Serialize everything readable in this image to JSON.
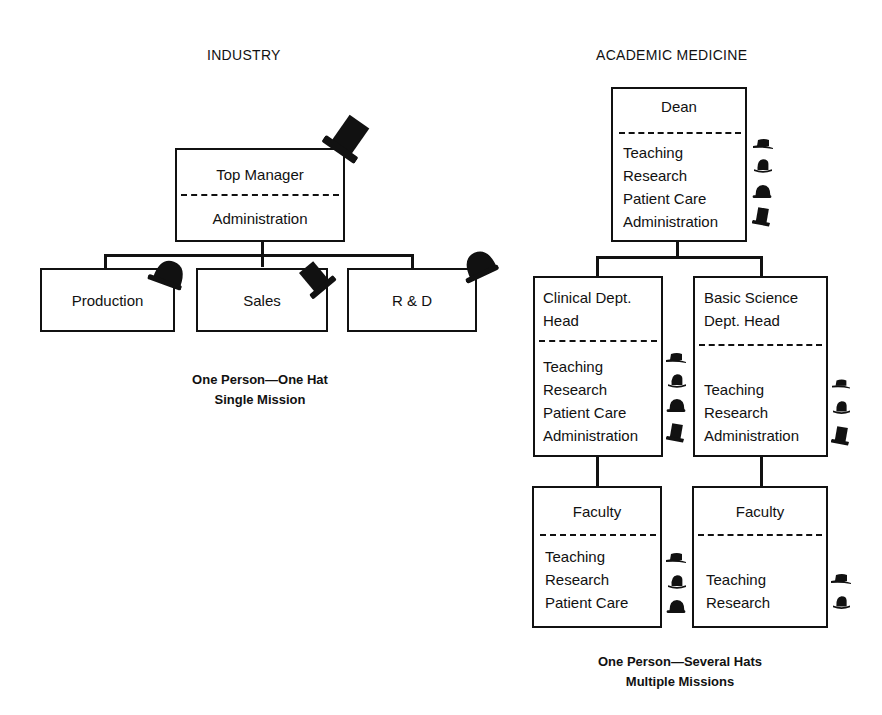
{
  "industry": {
    "heading": "INDUSTRY",
    "top": {
      "title": "Top Manager",
      "role": "Administration",
      "hat": "top-hat"
    },
    "children": [
      {
        "title": "Production",
        "hat": "bowler-hat"
      },
      {
        "title": "Sales",
        "hat": "top-hat"
      },
      {
        "title": "R & D",
        "hat": "bowler-hat"
      }
    ],
    "caption": {
      "line1": "One Person—One Hat",
      "line2": "Single Mission"
    }
  },
  "academic": {
    "heading": "ACADEMIC MEDICINE",
    "dean": {
      "title": "Dean",
      "roles": [
        "Teaching",
        "Research",
        "Patient Care",
        "Administration"
      ]
    },
    "clinical_head": {
      "title_line1": "Clinical Dept.",
      "title_line2": "Head",
      "roles": [
        "Teaching",
        "Research",
        "Patient Care",
        "Administration"
      ]
    },
    "basic_head": {
      "title_line1": "Basic Science",
      "title_line2": "Dept. Head",
      "roles": [
        "Teaching",
        "Research",
        "Administration"
      ]
    },
    "clinical_faculty": {
      "title": "Faculty",
      "roles": [
        "Teaching",
        "Research",
        "Patient Care"
      ]
    },
    "basic_faculty": {
      "title": "Faculty",
      "roles": [
        "Teaching",
        "Research"
      ]
    },
    "caption": {
      "line1": "One Person—Several Hats",
      "line2": "Multiple Missions"
    }
  },
  "hat_legend": {
    "Teaching": "flat-hat",
    "Research": "fedora-hat",
    "Patient Care": "bowler-hat",
    "Administration": "top-hat"
  }
}
